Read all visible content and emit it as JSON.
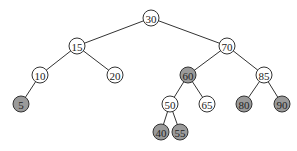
{
  "diagram": {
    "type": "binary-search-tree",
    "colors": {
      "white": "#ffffff",
      "shaded": "#9a9a9a",
      "stroke": "#333333"
    },
    "radius": 8,
    "nodes": [
      {
        "id": "n30",
        "label": "30",
        "x": 151,
        "y": 18,
        "shaded": false
      },
      {
        "id": "n15",
        "label": "15",
        "x": 77,
        "y": 46,
        "shaded": false
      },
      {
        "id": "n70",
        "label": "70",
        "x": 227,
        "y": 46,
        "shaded": false
      },
      {
        "id": "n10",
        "label": "10",
        "x": 40,
        "y": 75,
        "shaded": false
      },
      {
        "id": "n20",
        "label": "20",
        "x": 115,
        "y": 75,
        "shaded": false
      },
      {
        "id": "n60",
        "label": "60",
        "x": 188,
        "y": 75,
        "shaded": true
      },
      {
        "id": "n85",
        "label": "85",
        "x": 264,
        "y": 75,
        "shaded": false
      },
      {
        "id": "n5",
        "label": "5",
        "x": 21,
        "y": 104,
        "shaded": true
      },
      {
        "id": "n50",
        "label": "50",
        "x": 170,
        "y": 104,
        "shaded": false
      },
      {
        "id": "n65",
        "label": "65",
        "x": 207,
        "y": 104,
        "shaded": false
      },
      {
        "id": "n80",
        "label": "80",
        "x": 244,
        "y": 104,
        "shaded": true
      },
      {
        "id": "n90",
        "label": "90",
        "x": 282,
        "y": 104,
        "shaded": true
      },
      {
        "id": "n40",
        "label": "40",
        "x": 161,
        "y": 132,
        "shaded": true
      },
      {
        "id": "n55",
        "label": "55",
        "x": 180,
        "y": 132,
        "shaded": true
      }
    ],
    "edges": [
      [
        "n30",
        "n15"
      ],
      [
        "n30",
        "n70"
      ],
      [
        "n15",
        "n10"
      ],
      [
        "n15",
        "n20"
      ],
      [
        "n70",
        "n60"
      ],
      [
        "n70",
        "n85"
      ],
      [
        "n10",
        "n5"
      ],
      [
        "n60",
        "n50"
      ],
      [
        "n60",
        "n65"
      ],
      [
        "n85",
        "n80"
      ],
      [
        "n85",
        "n90"
      ],
      [
        "n50",
        "n40"
      ],
      [
        "n50",
        "n55"
      ]
    ]
  }
}
